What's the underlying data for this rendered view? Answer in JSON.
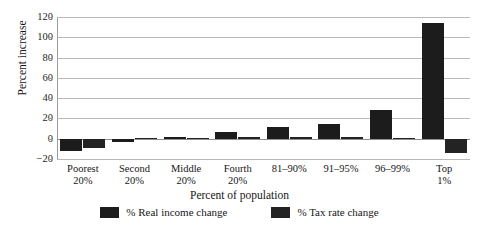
{
  "chart_data": {
    "type": "bar",
    "title": "",
    "xlabel": "Percent of population",
    "ylabel": "Percent increase",
    "categories": [
      "Poorest 20%",
      "Second 20%",
      "Middle 20%",
      "Fourth 20%",
      "81–90%",
      "91–95%",
      "96–99%",
      "Top 1%"
    ],
    "category_lines": [
      [
        "Poorest",
        "20%"
      ],
      [
        "Second",
        "20%"
      ],
      [
        "Middle",
        "20%"
      ],
      [
        "Fourth",
        "20%"
      ],
      [
        "81–90%",
        ""
      ],
      [
        "91–95%",
        ""
      ],
      [
        "96–99%",
        ""
      ],
      [
        "Top",
        "1%"
      ]
    ],
    "series": [
      {
        "name": "% Real income change",
        "color": "#1c1c1c",
        "values": [
          -12,
          -3,
          2,
          7,
          12,
          15,
          28,
          114
        ]
      },
      {
        "name": "% Tax rate change",
        "color": "#232323",
        "values": [
          -9,
          1,
          1,
          2,
          2,
          2,
          1,
          -14
        ]
      }
    ],
    "ylim": [
      -20,
      120
    ],
    "yticks": [
      -20,
      0,
      20,
      40,
      60,
      80,
      100,
      120
    ],
    "ytick_labels": [
      "−20",
      "0",
      "20",
      "40",
      "60",
      "80",
      "100",
      "120"
    ],
    "grid": true,
    "legend_position": "bottom"
  },
  "legend": {
    "items": [
      {
        "label": "% Real income change",
        "color": "#1c1c1c"
      },
      {
        "label": "% Tax rate change",
        "color": "#232323"
      }
    ]
  }
}
